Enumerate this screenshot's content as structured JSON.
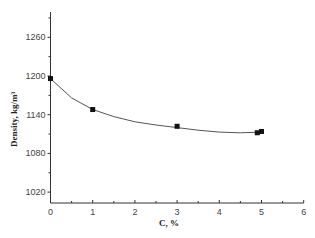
{
  "chart_data": {
    "type": "scatter",
    "title": "",
    "xlabel": "C, %",
    "ylabel": "Density, kg/m³",
    "xlim": [
      0,
      6
    ],
    "ylim": [
      1000,
      1300
    ],
    "x_ticks": [
      "0",
      "1",
      "2",
      "3",
      "4",
      "5",
      "6"
    ],
    "y_ticks": [
      "1020",
      "1080",
      "1140",
      "1200",
      "1260"
    ],
    "grid": false,
    "legend": null,
    "series": [
      {
        "name": "measured",
        "marker": "square",
        "x": [
          0,
          1,
          3,
          4.9,
          5
        ],
        "y": [
          1196,
          1148,
          1122,
          1112,
          1114
        ]
      },
      {
        "name": "fit",
        "line": "smooth curve",
        "x": [
          0,
          0.5,
          1,
          1.5,
          2,
          2.5,
          3,
          3.5,
          4,
          4.5,
          5
        ],
        "y": [
          1196,
          1166,
          1148,
          1137,
          1129,
          1124,
          1120,
          1116,
          1113,
          1112,
          1113
        ]
      }
    ]
  }
}
